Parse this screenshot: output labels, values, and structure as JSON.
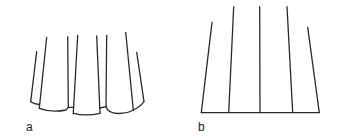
{
  "figures": [
    {
      "label": "a",
      "description": "pleated skirt-like form with scalloped hem",
      "lines": [
        {
          "x1": 36.7,
          "y1": 51.7,
          "x2": 30.7,
          "y2": 101.7
        },
        {
          "x1": 46.7,
          "y1": 37.3,
          "x2": 39.3,
          "y2": 108.3
        },
        {
          "x1": 67.7,
          "y1": 36.7,
          "x2": 68.3,
          "y2": 107.3
        },
        {
          "x1": 77.7,
          "y1": 35.3,
          "x2": 73.3,
          "y2": 113.3
        },
        {
          "x1": 96.7,
          "y1": 36.0,
          "x2": 100.0,
          "y2": 113.3
        },
        {
          "x1": 106.7,
          "y1": 35.3,
          "x2": 106.0,
          "y2": 106.7
        },
        {
          "x1": 125.7,
          "y1": 32.3,
          "x2": 133.3,
          "y2": 110.0
        },
        {
          "x1": 136.7,
          "y1": 52.3,
          "x2": 144.0,
          "y2": 101.7
        }
      ]
    },
    {
      "label": "b",
      "description": "fan of lines meeting a straight baseline",
      "lines": [
        {
          "x1": 212.0,
          "y1": 22.3,
          "x2": 201.3,
          "y2": 112.7
        },
        {
          "x1": 233.7,
          "y1": 6.7,
          "x2": 228.7,
          "y2": 112.7
        },
        {
          "x1": 259.7,
          "y1": 6.7,
          "x2": 260.0,
          "y2": 112.7
        },
        {
          "x1": 287.0,
          "y1": 6.7,
          "x2": 292.7,
          "y2": 112.7
        },
        {
          "x1": 307.7,
          "y1": 27.3,
          "x2": 319.3,
          "y2": 112.7
        }
      ],
      "baseline": {
        "x1": 201.3,
        "y1": 112.7,
        "x2": 319.3,
        "y2": 112.7
      }
    }
  ],
  "colors": {
    "stroke": "#2a2a2a",
    "background": "#ffffff"
  }
}
